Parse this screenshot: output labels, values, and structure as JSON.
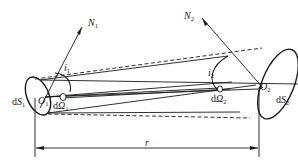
{
  "diagram": {
    "type": "radiative-exchange-geometry",
    "stroke_color": "#1a1a1a",
    "background": "#ffffff",
    "labels": {
      "normal1": {
        "main": "N",
        "sub": "1"
      },
      "normal2": {
        "main": "N",
        "sub": "2"
      },
      "angle1": {
        "main": "i",
        "sub": "1"
      },
      "angle2": {
        "main": "i",
        "sub": "2"
      },
      "origin1": {
        "main": "O",
        "sub": "1"
      },
      "origin2": {
        "main": "O",
        "sub": "2"
      },
      "area1": {
        "prefix": "d",
        "main": "S",
        "sub": "1"
      },
      "area2": {
        "prefix": "d",
        "main": "S",
        "sub": "2"
      },
      "solid_angle1": {
        "prefix": "d",
        "main": "Ω",
        "sub": "1"
      },
      "solid_angle2": {
        "prefix": "d",
        "main": "Ω",
        "sub": "2"
      },
      "distance": "r"
    }
  }
}
